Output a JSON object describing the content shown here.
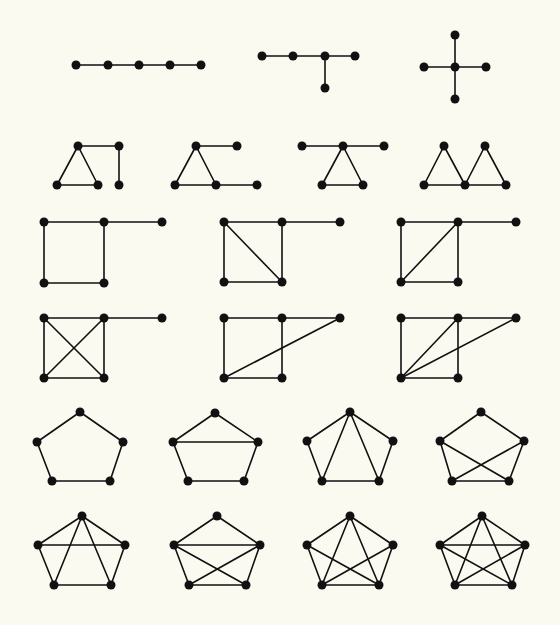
{
  "figure": {
    "background": "#fbfaf1",
    "ink_color": "#111111",
    "node_radius": 4.5
  },
  "graphs": [
    {
      "id": "path-p5",
      "row": 1,
      "nodes": [
        [
          76,
          65
        ],
        [
          108,
          65
        ],
        [
          139,
          65
        ],
        [
          170,
          65
        ],
        [
          201,
          65
        ]
      ],
      "edges": [
        [
          0,
          1
        ],
        [
          1,
          2
        ],
        [
          2,
          3
        ],
        [
          3,
          4
        ]
      ]
    },
    {
      "id": "spider-t",
      "row": 1,
      "nodes": [
        [
          262,
          56
        ],
        [
          293,
          56
        ],
        [
          325,
          56
        ],
        [
          355,
          56
        ],
        [
          325,
          88
        ]
      ],
      "edges": [
        [
          0,
          1
        ],
        [
          1,
          2
        ],
        [
          2,
          3
        ],
        [
          2,
          4
        ]
      ]
    },
    {
      "id": "star-k14",
      "row": 1,
      "nodes": [
        [
          455,
          67
        ],
        [
          455,
          35
        ],
        [
          455,
          99
        ],
        [
          424,
          67
        ],
        [
          486,
          67
        ]
      ],
      "edges": [
        [
          0,
          1
        ],
        [
          0,
          2
        ],
        [
          0,
          3
        ],
        [
          0,
          4
        ]
      ]
    },
    {
      "id": "triangle-with-path",
      "row": 2,
      "nodes": [
        [
          78,
          146
        ],
        [
          119,
          146
        ],
        [
          57,
          185
        ],
        [
          98,
          185
        ],
        [
          119,
          185
        ]
      ],
      "edges": [
        [
          0,
          2
        ],
        [
          0,
          3
        ],
        [
          2,
          3
        ],
        [
          0,
          1
        ],
        [
          1,
          4
        ]
      ]
    },
    {
      "id": "bull-like",
      "row": 2,
      "nodes": [
        [
          196,
          146
        ],
        [
          237,
          146
        ],
        [
          175,
          185
        ],
        [
          216,
          185
        ],
        [
          257,
          185
        ]
      ],
      "edges": [
        [
          0,
          2
        ],
        [
          0,
          3
        ],
        [
          2,
          3
        ],
        [
          0,
          1
        ],
        [
          3,
          4
        ]
      ]
    },
    {
      "id": "cricket",
      "row": 2,
      "nodes": [
        [
          302,
          146
        ],
        [
          343,
          146
        ],
        [
          384,
          146
        ],
        [
          322,
          185
        ],
        [
          363,
          185
        ]
      ],
      "edges": [
        [
          0,
          1
        ],
        [
          1,
          2
        ],
        [
          1,
          3
        ],
        [
          1,
          4
        ],
        [
          3,
          4
        ]
      ]
    },
    {
      "id": "butterfly",
      "row": 2,
      "nodes": [
        [
          444,
          146
        ],
        [
          485,
          146
        ],
        [
          424,
          185
        ],
        [
          465,
          185
        ],
        [
          506,
          185
        ]
      ],
      "edges": [
        [
          0,
          2
        ],
        [
          0,
          3
        ],
        [
          2,
          3
        ],
        [
          1,
          3
        ],
        [
          1,
          4
        ],
        [
          3,
          4
        ]
      ]
    },
    {
      "id": "square-with-tail",
      "row": 3,
      "nodes": [
        [
          44,
          222
        ],
        [
          104,
          222
        ],
        [
          44,
          283
        ],
        [
          104,
          283
        ],
        [
          162,
          222
        ]
      ],
      "edges": [
        [
          0,
          1
        ],
        [
          0,
          2
        ],
        [
          1,
          3
        ],
        [
          2,
          3
        ],
        [
          1,
          4
        ]
      ]
    },
    {
      "id": "square-diag-tail-a",
      "row": 3,
      "nodes": [
        [
          224,
          222
        ],
        [
          282,
          222
        ],
        [
          224,
          282
        ],
        [
          282,
          282
        ],
        [
          340,
          222
        ]
      ],
      "edges": [
        [
          0,
          1
        ],
        [
          0,
          2
        ],
        [
          1,
          3
        ],
        [
          2,
          3
        ],
        [
          0,
          3
        ],
        [
          1,
          4
        ]
      ]
    },
    {
      "id": "square-diag-tail-b",
      "row": 3,
      "nodes": [
        [
          401,
          222
        ],
        [
          458,
          222
        ],
        [
          401,
          282
        ],
        [
          458,
          282
        ],
        [
          516,
          222
        ]
      ],
      "edges": [
        [
          0,
          1
        ],
        [
          0,
          2
        ],
        [
          1,
          3
        ],
        [
          2,
          3
        ],
        [
          2,
          1
        ],
        [
          1,
          4
        ]
      ]
    },
    {
      "id": "k4-with-tail",
      "row": 4,
      "nodes": [
        [
          44,
          318
        ],
        [
          104,
          318
        ],
        [
          44,
          378
        ],
        [
          104,
          378
        ],
        [
          162,
          318
        ]
      ],
      "edges": [
        [
          0,
          1
        ],
        [
          0,
          2
        ],
        [
          1,
          3
        ],
        [
          2,
          3
        ],
        [
          0,
          3
        ],
        [
          1,
          2
        ],
        [
          1,
          4
        ]
      ]
    },
    {
      "id": "square-tail-chord",
      "row": 4,
      "nodes": [
        [
          224,
          318
        ],
        [
          282,
          318
        ],
        [
          224,
          378
        ],
        [
          282,
          378
        ],
        [
          340,
          318
        ]
      ],
      "edges": [
        [
          0,
          1
        ],
        [
          0,
          2
        ],
        [
          1,
          3
        ],
        [
          2,
          3
        ],
        [
          1,
          4
        ],
        [
          2,
          4
        ]
      ]
    },
    {
      "id": "square-tail-double-chord",
      "row": 4,
      "nodes": [
        [
          401,
          318
        ],
        [
          458,
          318
        ],
        [
          401,
          378
        ],
        [
          458,
          378
        ],
        [
          516,
          318
        ]
      ],
      "edges": [
        [
          0,
          1
        ],
        [
          0,
          2
        ],
        [
          1,
          3
        ],
        [
          2,
          3
        ],
        [
          1,
          4
        ],
        [
          2,
          1
        ],
        [
          2,
          4
        ]
      ]
    },
    {
      "id": "cycle-c5",
      "row": 5,
      "nodes": [
        [
          80,
          412
        ],
        [
          37,
          442
        ],
        [
          123,
          442
        ],
        [
          52,
          481
        ],
        [
          110,
          481
        ]
      ],
      "edges": [
        [
          0,
          1
        ],
        [
          0,
          2
        ],
        [
          1,
          3
        ],
        [
          2,
          4
        ],
        [
          3,
          4
        ]
      ]
    },
    {
      "id": "house",
      "row": 5,
      "nodes": [
        [
          215,
          413
        ],
        [
          173,
          442
        ],
        [
          258,
          442
        ],
        [
          188,
          481
        ],
        [
          244,
          481
        ]
      ],
      "edges": [
        [
          0,
          1
        ],
        [
          0,
          2
        ],
        [
          1,
          3
        ],
        [
          2,
          4
        ],
        [
          3,
          4
        ],
        [
          1,
          2
        ]
      ]
    },
    {
      "id": "fan-c5-two-chords",
      "row": 5,
      "nodes": [
        [
          350,
          412
        ],
        [
          307,
          441
        ],
        [
          393,
          441
        ],
        [
          322,
          481
        ],
        [
          379,
          481
        ]
      ],
      "edges": [
        [
          0,
          1
        ],
        [
          0,
          2
        ],
        [
          1,
          3
        ],
        [
          2,
          4
        ],
        [
          3,
          4
        ],
        [
          0,
          3
        ],
        [
          0,
          4
        ]
      ]
    },
    {
      "id": "c5-crossed-chords",
      "row": 5,
      "nodes": [
        [
          481,
          412
        ],
        [
          440,
          441
        ],
        [
          524,
          441
        ],
        [
          452,
          481
        ],
        [
          509,
          481
        ]
      ],
      "edges": [
        [
          0,
          1
        ],
        [
          0,
          2
        ],
        [
          1,
          3
        ],
        [
          2,
          4
        ],
        [
          3,
          4
        ],
        [
          1,
          4
        ],
        [
          2,
          3
        ]
      ]
    },
    {
      "id": "c5-three-chords-a",
      "row": 6,
      "nodes": [
        [
          82,
          516
        ],
        [
          38,
          545
        ],
        [
          125,
          545
        ],
        [
          54,
          585
        ],
        [
          111,
          585
        ]
      ],
      "edges": [
        [
          0,
          1
        ],
        [
          0,
          2
        ],
        [
          1,
          3
        ],
        [
          2,
          4
        ],
        [
          3,
          4
        ],
        [
          1,
          2
        ],
        [
          0,
          3
        ],
        [
          0,
          4
        ]
      ]
    },
    {
      "id": "c5-three-chords-b",
      "row": 6,
      "nodes": [
        [
          217,
          516
        ],
        [
          174,
          545
        ],
        [
          260,
          545
        ],
        [
          189,
          585
        ],
        [
          246,
          585
        ]
      ],
      "edges": [
        [
          0,
          1
        ],
        [
          0,
          2
        ],
        [
          1,
          3
        ],
        [
          2,
          4
        ],
        [
          3,
          4
        ],
        [
          1,
          2
        ],
        [
          1,
          4
        ],
        [
          2,
          3
        ]
      ]
    },
    {
      "id": "k5-minus-edge",
      "row": 6,
      "nodes": [
        [
          350,
          516
        ],
        [
          307,
          545
        ],
        [
          393,
          545
        ],
        [
          322,
          585
        ],
        [
          379,
          585
        ]
      ],
      "edges": [
        [
          0,
          1
        ],
        [
          0,
          2
        ],
        [
          1,
          3
        ],
        [
          2,
          4
        ],
        [
          3,
          4
        ],
        [
          0,
          3
        ],
        [
          0,
          4
        ],
        [
          1,
          4
        ],
        [
          2,
          3
        ]
      ]
    },
    {
      "id": "complete-k5",
      "row": 6,
      "nodes": [
        [
          482,
          516
        ],
        [
          440,
          545
        ],
        [
          525,
          545
        ],
        [
          455,
          585
        ],
        [
          512,
          585
        ]
      ],
      "edges": [
        [
          0,
          1
        ],
        [
          0,
          2
        ],
        [
          1,
          3
        ],
        [
          2,
          4
        ],
        [
          3,
          4
        ],
        [
          1,
          2
        ],
        [
          0,
          3
        ],
        [
          0,
          4
        ],
        [
          1,
          4
        ],
        [
          2,
          3
        ]
      ]
    }
  ]
}
